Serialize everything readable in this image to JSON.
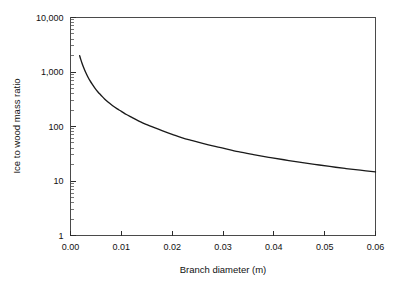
{
  "chart_data": {
    "type": "line",
    "title": "",
    "xlabel": "Branch diameter (m)",
    "ylabel": "Ice to wood mass ratio",
    "xlim": [
      0.0,
      0.06
    ],
    "ylim": [
      1,
      10000
    ],
    "yscale": "log",
    "xscale": "linear",
    "grid": false,
    "legend": null,
    "x_tick_labels": [
      "0.00",
      "0.01",
      "0.02",
      "0.03",
      "0.04",
      "0.05",
      "0.06"
    ],
    "x_tick_values": [
      0.0,
      0.01,
      0.02,
      0.03,
      0.04,
      0.05,
      0.06
    ],
    "y_tick_labels": [
      "10,000",
      "1,000",
      "100",
      "10",
      "1"
    ],
    "y_tick_values": [
      10000,
      1000,
      100,
      10,
      1
    ],
    "series": [
      {
        "name": "Ice to wood mass ratio",
        "x": [
          0.0018,
          0.002,
          0.0023,
          0.0026,
          0.003,
          0.0034,
          0.0038,
          0.0043,
          0.0048,
          0.0054,
          0.006,
          0.0067,
          0.0075,
          0.0083,
          0.0092,
          0.01,
          0.011,
          0.012,
          0.013,
          0.014,
          0.015,
          0.0165,
          0.018,
          0.02,
          0.022,
          0.024,
          0.026,
          0.028,
          0.03,
          0.033,
          0.036,
          0.039,
          0.042,
          0.045,
          0.048,
          0.051,
          0.054,
          0.057,
          0.06
        ],
        "y": [
          2000,
          1720,
          1420,
          1200,
          980,
          820,
          700,
          590,
          505,
          430,
          375,
          320,
          276,
          240,
          210,
          190,
          166,
          148,
          132,
          119,
          108,
          95,
          84,
          72,
          62,
          55,
          49,
          44,
          40,
          34.5,
          30.5,
          27.2,
          24.5,
          22.2,
          20.2,
          18.5,
          17.0,
          15.8,
          14.7
        ]
      }
    ],
    "annotations": []
  },
  "figure": {
    "background_color": "#ffffff",
    "line_color": "#1a1a1a",
    "frame_color": "#4a4a4a"
  }
}
